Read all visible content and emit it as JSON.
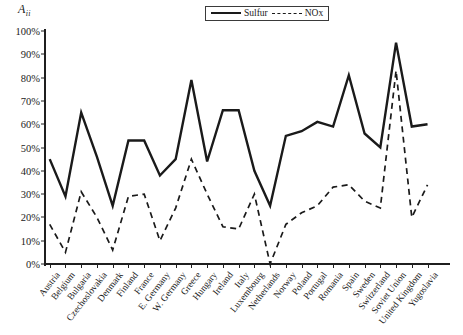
{
  "chart_data": {
    "type": "line",
    "title": "",
    "xlabel": "",
    "ylabel": "Aᵢᵢ",
    "ylabel_base": "A",
    "ylabel_sub": "ii",
    "ylim": [
      0,
      100
    ],
    "ytick_labels": [
      "0%",
      "10%",
      "20%",
      "30%",
      "40%",
      "50%",
      "60%",
      "70%",
      "80%",
      "90%",
      "100%"
    ],
    "ytick_values": [
      0,
      10,
      20,
      30,
      40,
      50,
      60,
      70,
      80,
      90,
      100
    ],
    "grid": false,
    "legend_position": "top-right",
    "categories": [
      "Austria",
      "Belgium",
      "Bulgaria",
      "Czechoslovakia",
      "Denmark",
      "Finland",
      "France",
      "E. Germany",
      "W. Germany",
      "Greece",
      "Hungary",
      "Ireland",
      "Italy",
      "Luxembourg",
      "Netherlands",
      "Norway",
      "Poland",
      "Portugal",
      "Romania",
      "Spain",
      "Sweden",
      "Switzerland",
      "Soviet Union",
      "United Kingdom",
      "Yugoslavia"
    ],
    "series": [
      {
        "name": "Sulfur",
        "style": "solid",
        "color": "#1a1a1a",
        "values": [
          45,
          29,
          65,
          46,
          25,
          53,
          53,
          38,
          45,
          79,
          44,
          66,
          66,
          40,
          25,
          55,
          57,
          61,
          59,
          81,
          56,
          50,
          95,
          59,
          60
        ]
      },
      {
        "name": "NOx",
        "style": "dashed",
        "color": "#1a1a1a",
        "values": [
          17,
          5,
          31,
          20,
          6,
          29,
          30,
          10,
          24,
          45,
          30,
          16,
          15,
          30,
          0,
          17,
          22,
          25,
          33,
          34,
          27,
          24,
          83,
          20,
          34
        ]
      }
    ]
  },
  "legend": {
    "items": [
      {
        "label": "Sulfur",
        "style": "solid"
      },
      {
        "label": "NOx",
        "style": "dashed"
      }
    ]
  }
}
